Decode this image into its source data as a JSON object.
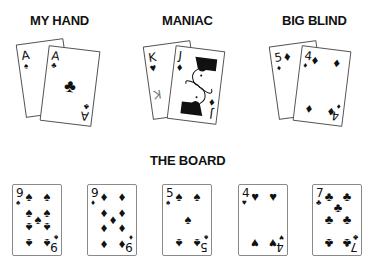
{
  "labels": {
    "my_hand": "MY HAND",
    "maniac": "MANIAC",
    "big_blind": "BIG BLIND",
    "board": "THE BOARD"
  },
  "suit_glyphs": {
    "spade": "♠",
    "club": "♣",
    "heart": "♥",
    "diamond": "♦"
  },
  "my_hand": [
    {
      "rank": "A",
      "suit": "spade",
      "glyph": "♠"
    },
    {
      "rank": "A",
      "suit": "club",
      "glyph": "♣"
    }
  ],
  "maniac": [
    {
      "rank": "K",
      "suit": "heart",
      "glyph": "♥"
    },
    {
      "rank": "J",
      "suit": "diamond",
      "glyph": "♦"
    }
  ],
  "big_blind": [
    {
      "rank": "5",
      "suit": "diamond",
      "glyph": "♦"
    },
    {
      "rank": "4",
      "suit": "diamond",
      "glyph": "♦"
    }
  ],
  "board": [
    {
      "rank": "9",
      "suit": "spade",
      "glyph": "♠"
    },
    {
      "rank": "9",
      "suit": "diamond",
      "glyph": "♦"
    },
    {
      "rank": "5",
      "suit": "spade",
      "glyph": "♠"
    },
    {
      "rank": "4",
      "suit": "heart",
      "glyph": "♥"
    },
    {
      "rank": "7",
      "suit": "club",
      "glyph": "♣"
    }
  ]
}
